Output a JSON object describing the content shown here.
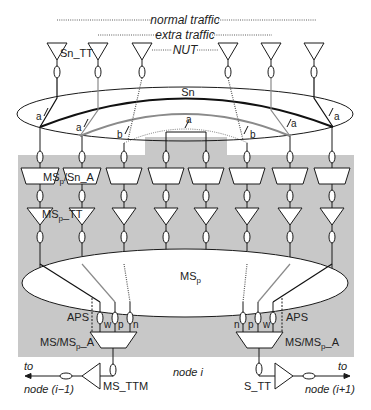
{
  "legend": {
    "normal_traffic": "normal traffic",
    "extra_traffic": "extra traffic",
    "nut": "NUT"
  },
  "labels": {
    "sn_tt": "Sn_TT",
    "sn": "Sn",
    "a": "a",
    "b": "b",
    "msp_sn_a_main": "MS",
    "msp_sub": "p",
    "msp_sn_a_tail": "/Sn_A",
    "msp_tt_main": "MS",
    "msp_tt_tail": "_TT",
    "msp_ring_main": "MS",
    "aps": "APS",
    "w": "w",
    "p": "p",
    "n": "n",
    "ms_msp_a_head": "MS/MS",
    "ms_msp_a_tail": "_A",
    "to": "to",
    "node_prev": "node (i−1)",
    "node_next": "node (i+1)",
    "node_i": "node i",
    "ms_ttm": "MS_TTM",
    "s_tt": "S_TT"
  },
  "colors": {
    "shade": "#c8c8c8",
    "line": "#1a1a1a",
    "gray_line": "#8a8a8a"
  }
}
